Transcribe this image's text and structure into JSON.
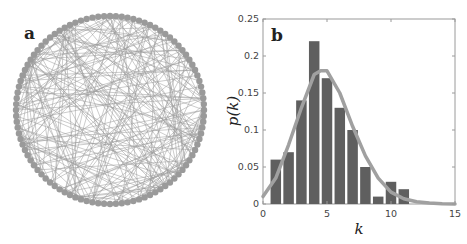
{
  "panel_a": {
    "label": "a",
    "description": "circular network of nodes with random edges",
    "node_color": "#9a9a9a",
    "edge_color": "#9a9a9a",
    "node_count": 100
  },
  "panel_b": {
    "label": "b"
  },
  "chart_data": {
    "type": "bar",
    "title": "",
    "panel_label": "b",
    "xlabel": "k",
    "ylabel": "p(k)",
    "xlim": [
      0,
      15
    ],
    "ylim": [
      0,
      0.25
    ],
    "xticks": [
      0,
      5,
      10,
      15
    ],
    "yticks": [
      0,
      0.05,
      0.1,
      0.15,
      0.2,
      0.25
    ],
    "ytick_labels": [
      "0",
      "0.05",
      "0.1",
      "0.15",
      "0.2",
      "0.25"
    ],
    "grid": false,
    "series": [
      {
        "name": "empirical degree distribution",
        "type": "bar",
        "color": "#5f5f5f",
        "x": [
          1,
          2,
          3,
          4,
          5,
          6,
          7,
          8,
          9,
          10,
          11
        ],
        "values": [
          0.06,
          0.07,
          0.14,
          0.22,
          0.17,
          0.13,
          0.1,
          0.05,
          0.01,
          0.03,
          0.02
        ]
      },
      {
        "name": "fitted curve",
        "type": "line",
        "color": "#a0a0a0",
        "x": [
          0,
          1,
          2,
          3,
          4,
          4.5,
          5,
          6,
          7,
          8,
          9,
          10,
          11,
          12,
          13,
          14,
          15
        ],
        "values": [
          0.01,
          0.035,
          0.08,
          0.13,
          0.175,
          0.18,
          0.18,
          0.15,
          0.105,
          0.065,
          0.035,
          0.016,
          0.007,
          0.003,
          0.0015,
          0.0005,
          0.0
        ]
      }
    ]
  }
}
